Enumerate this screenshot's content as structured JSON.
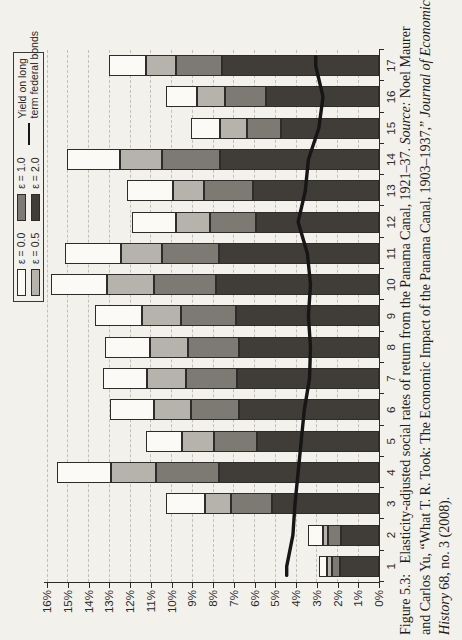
{
  "figure": {
    "caption_lines": [
      [
        {
          "t": "Figure 5.3:  Elasticity-adjusted social rates of return from the Panama Canal, 1921–37. ",
          "i": false
        },
        {
          "t": "Source:",
          "i": true
        },
        {
          "t": " Noel Maurer",
          "i": false
        }
      ],
      [
        {
          "t": "and Carlos Yu, “What T. R. Took: The Economic Impact of the Panama Canal, 1903–1937,” ",
          "i": false
        },
        {
          "t": "Journal of Economic",
          "i": true
        }
      ],
      [
        {
          "t": "History",
          "i": true
        },
        {
          "t": " 68, no. 3 (2008).",
          "i": false
        }
      ]
    ],
    "page_rotation": "figure printed rotated 90° counterclockwise on portrait page"
  },
  "legend": {
    "entries": [
      {
        "label": "ε = 0.0",
        "color": "#fbfaf6"
      },
      {
        "label": "ε = 0.5",
        "color": "#b6b3ad"
      },
      {
        "label": "ε = 1.0",
        "color": "#7d7a74"
      },
      {
        "label": "ε = 2.0",
        "color": "#403d39"
      },
      {
        "label": "Yield on long term federal bonds",
        "line1": "Yield on long",
        "line2": "term federal bonds",
        "color": "#161616"
      }
    ]
  },
  "chart_data": {
    "type": "bar",
    "stacked": true,
    "title": "",
    "xlabel": "",
    "ylabel": "",
    "ylim": [
      0,
      16
    ],
    "ytick_step": 1,
    "ytick_format": "percent",
    "grid": "dashed horizontal gridlines at every 1%",
    "legend_position": "top-right, boxed",
    "categories": [
      1,
      2,
      3,
      4,
      5,
      6,
      7,
      8,
      9,
      10,
      11,
      12,
      13,
      14,
      15,
      16,
      17
    ],
    "categories_note": "years 1–17 correspond to 1921–1937",
    "series_note": "bar series are cumulative stack tops in % (rate of return at each elasticity); dark ε=2.0 segment drawn from 0, lighter segments stacked above up to the ε=0.0 total",
    "series": [
      {
        "name": "ε = 0.0",
        "role": "bar-total",
        "color": "#fbfaf6",
        "values": [
          2.9,
          3.4,
          10.25,
          15.5,
          11.25,
          12.95,
          13.3,
          13.2,
          13.7,
          15.8,
          15.15,
          11.9,
          12.15,
          15.05,
          9.05,
          10.25,
          13.0
        ]
      },
      {
        "name": "ε = 0.5",
        "role": "bar-cumulative",
        "color": "#b6b3ad",
        "values": [
          2.5,
          2.7,
          8.4,
          12.9,
          9.5,
          10.85,
          11.2,
          11.05,
          11.4,
          13.1,
          12.45,
          9.8,
          9.95,
          12.5,
          7.65,
          8.75,
          11.25
        ]
      },
      {
        "name": "ε = 1.0",
        "role": "bar-cumulative",
        "color": "#7d7a74",
        "values": [
          2.25,
          2.45,
          7.15,
          10.75,
          7.95,
          9.05,
          9.3,
          9.2,
          9.55,
          10.85,
          10.45,
          8.15,
          8.45,
          10.45,
          6.35,
          7.4,
          9.8
        ]
      },
      {
        "name": "ε = 2.0",
        "role": "bar-cumulative",
        "color": "#403d39",
        "values": [
          1.9,
          1.85,
          5.15,
          7.7,
          5.9,
          6.75,
          6.85,
          6.75,
          6.9,
          7.85,
          7.7,
          5.95,
          6.05,
          7.65,
          4.7,
          5.45,
          7.55
        ]
      },
      {
        "name": "Yield on long term federal bonds",
        "role": "line",
        "color": "#161616",
        "values": [
          4.45,
          4.15,
          4.05,
          3.9,
          3.75,
          3.6,
          3.35,
          3.3,
          3.4,
          3.3,
          3.45,
          3.9,
          3.55,
          3.4,
          2.9,
          2.7,
          3.05
        ]
      }
    ]
  }
}
